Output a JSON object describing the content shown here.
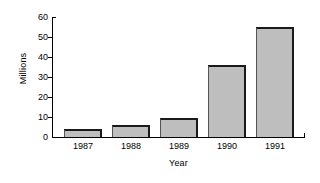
{
  "chart_data": {
    "type": "bar",
    "title": "",
    "xlabel": "Year",
    "ylabel": "Millions",
    "categories": [
      "1987",
      "1988",
      "1989",
      "1990",
      "1991"
    ],
    "values": [
      4,
      6,
      9.5,
      36,
      55
    ],
    "ylim": [
      0,
      60
    ],
    "yticks": [
      0,
      10,
      20,
      30,
      40,
      50,
      60
    ],
    "ytick_labels": [
      "0",
      "10",
      "20",
      "30",
      "40",
      "50",
      "60"
    ],
    "grid": false,
    "legend": null,
    "legend_position": "none",
    "bar_fill_color": "#bebebe",
    "bar_edge_color": "#1a1a1a",
    "axis_color": "#000000",
    "background_color": "#ffffff"
  }
}
